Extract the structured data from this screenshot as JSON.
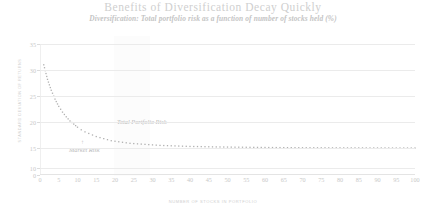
{
  "chart_data": {
    "type": "scatter",
    "title": "Benefits of Diversification Decay Quickly",
    "subtitle": "Diversification: Total portfolio risk as a function of number of stocks held (%)",
    "xlabel": "NUMBER OF STOCKS IN PORTFOLIO",
    "ylabel": "STANDARD DEVIATION OF RETURNS",
    "xlim": [
      0,
      100
    ],
    "ylim": [
      0,
      35
    ],
    "grid": true,
    "legend": "none",
    "marker": "dotted",
    "series_color": "#b0b0b0",
    "grid_color": "#ebebeb",
    "text_color": "#c9c9c9",
    "yticks": [
      0,
      10,
      15,
      20,
      25,
      30,
      35
    ],
    "xticks": [
      0,
      5,
      10,
      15,
      20,
      25,
      30,
      35,
      40,
      45,
      50,
      55,
      60,
      65,
      70,
      75,
      80,
      85,
      90,
      95,
      100
    ],
    "annotations": [
      {
        "label": "Total Portfolio Risk",
        "x": 22,
        "y": 18.6
      },
      {
        "label": "Market Risk",
        "x": 11,
        "y": 14.3
      },
      {
        "label": "arrow-up",
        "x": 14,
        "y": 15.6
      }
    ],
    "series": [
      {
        "name": "Total Portfolio Risk",
        "x": [
          1,
          2,
          3,
          4,
          5,
          6,
          7,
          8,
          9,
          10,
          11,
          12,
          13,
          14,
          15,
          16,
          17,
          18,
          19,
          20,
          22,
          24,
          26,
          28,
          30,
          32,
          34,
          36,
          38,
          40,
          42,
          44,
          46,
          48,
          50,
          52,
          54,
          56,
          58,
          60,
          62,
          64,
          66,
          68,
          70,
          72,
          74,
          76,
          78,
          80,
          82,
          84,
          86,
          88,
          90,
          92,
          94,
          96,
          98,
          100
        ],
        "y": [
          31.0,
          28.2,
          26.1,
          24.4,
          23.0,
          21.9,
          21.0,
          20.2,
          19.6,
          19.0,
          18.5,
          18.1,
          17.8,
          17.5,
          17.2,
          17.0,
          16.8,
          16.6,
          16.4,
          16.3,
          16.1,
          15.9,
          15.8,
          15.7,
          15.6,
          15.5,
          15.45,
          15.4,
          15.35,
          15.3,
          15.28,
          15.25,
          15.22,
          15.2,
          15.18,
          15.16,
          15.15,
          15.13,
          15.12,
          15.1,
          15.09,
          15.08,
          15.07,
          15.06,
          15.05,
          15.05,
          15.04,
          15.04,
          15.03,
          15.03,
          15.02,
          15.02,
          15.02,
          15.01,
          15.01,
          15.01,
          15.0,
          15.0,
          15.0,
          15.0
        ]
      }
    ],
    "market_risk_level": 15.0
  }
}
